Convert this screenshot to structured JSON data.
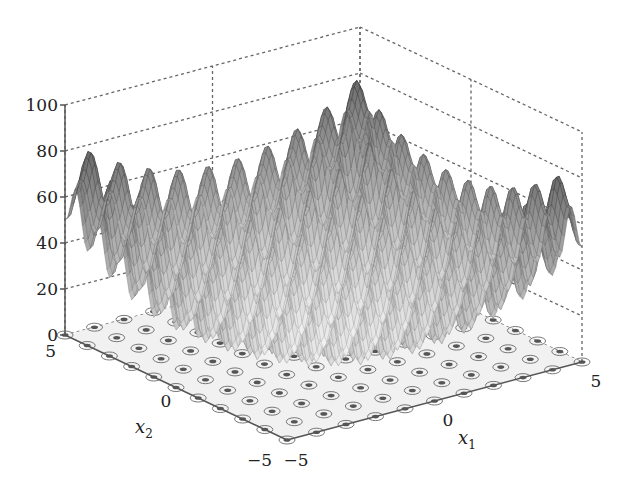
{
  "chart_data": {
    "type": "surface3d",
    "function": "Rastrigin: f(x1,x2) = 20 + x1^2 + x2^2 - 10(cos(2*pi*x1) + cos(2*pi*x2))",
    "title": "",
    "xlabel": "x1",
    "ylabel": "x2",
    "zlabel": "",
    "xlim": [
      -5,
      5
    ],
    "ylim": [
      -5,
      5
    ],
    "zlim": [
      0,
      100
    ],
    "x_ticks": [
      "-5",
      "0",
      "5"
    ],
    "y_ticks": [
      "-5",
      "0",
      "5"
    ],
    "z_ticks": [
      "0",
      "20",
      "40",
      "60",
      "80",
      "100"
    ],
    "grid": true,
    "contour_projection_on_floor": true,
    "colormap": "grayscale",
    "surface_color_dark": "#444444",
    "surface_color_light": "#dddddd",
    "legend": null
  },
  "axes": {
    "z_tick_labels": [
      "0",
      "20",
      "40",
      "60",
      "80",
      "100"
    ],
    "x1_tick_labels": [
      "-5",
      "0",
      "5"
    ],
    "x2_tick_labels": [
      "5",
      "0",
      "-5"
    ],
    "x1_label": "x",
    "x1_sub": "1",
    "x2_label": "x",
    "x2_sub": "2"
  }
}
